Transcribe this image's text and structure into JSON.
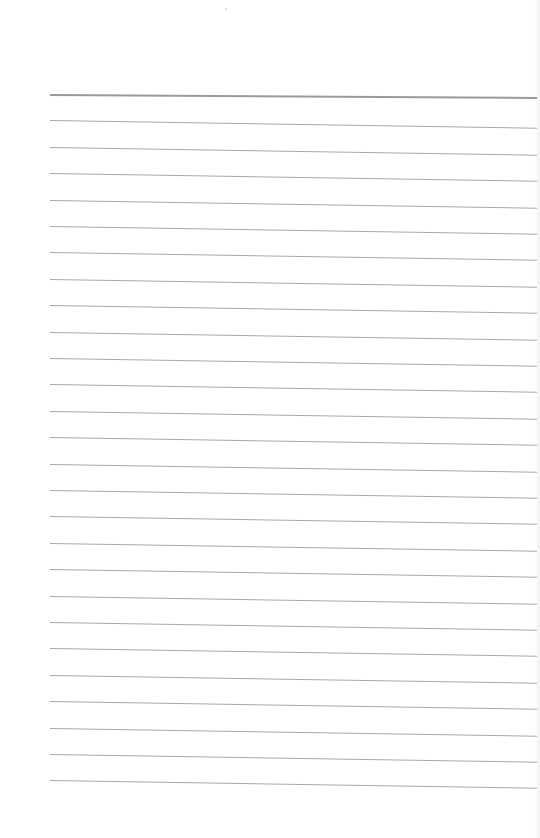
{
  "document": {
    "type": "lined-paper",
    "background_color": "#ffffff",
    "line_color": "#a9a9a9",
    "header_line_color": "#9a9a9a",
    "line_count": 27,
    "first_line_y": 94,
    "line_spacing": 26.4,
    "line_left_x": 50,
    "line_right_x": 537,
    "text": ""
  }
}
